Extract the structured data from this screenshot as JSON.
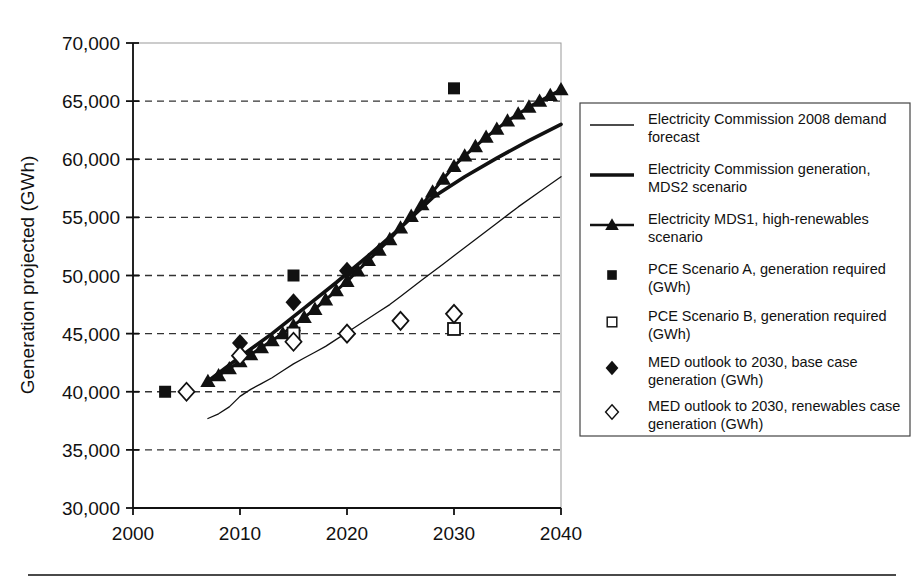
{
  "axes": {
    "ylabel": "Generation projected (GWh)",
    "xlabel": "",
    "yticks": [
      "30,000",
      "35,000",
      "40,000",
      "45,000",
      "50,000",
      "55,000",
      "60,000",
      "65,000",
      "70,000"
    ],
    "xticks": [
      "2000",
      "2010",
      "2020",
      "2030",
      "2040"
    ]
  },
  "legend": {
    "items": [
      {
        "marker": "thin-line",
        "label": "Electricity Commission 2008 demand forecast"
      },
      {
        "marker": "thick-line",
        "label": "Electricity Commission generation, MDS2 scenario"
      },
      {
        "marker": "line-triangle",
        "label": "Electricity MDS1, high-renewables scenario"
      },
      {
        "marker": "filled-square",
        "label": "PCE Scenario A, generation required (GWh)"
      },
      {
        "marker": "open-square",
        "label": "PCE Scenario B, generation required (GWh)"
      },
      {
        "marker": "filled-diamond",
        "label": "MED outlook to 2030, base case generation (GWh)"
      },
      {
        "marker": "open-diamond",
        "label": "MED outlook to 2030, renewables case generation (GWh)"
      }
    ]
  },
  "colors": {
    "ink": "#111111",
    "grid": "#333333",
    "frame": "#888888",
    "background": "#ffffff"
  },
  "chart_data": {
    "type": "line",
    "title": "",
    "xlabel": "",
    "ylabel": "Generation projected (GWh)",
    "xlim": [
      2000,
      2040
    ],
    "ylim": [
      30000,
      70000
    ],
    "grid": "horizontal-dashed",
    "legend_position": "right",
    "series": [
      {
        "name": "Electricity Commission 2008 demand forecast",
        "type": "line",
        "style": "thin-solid",
        "points": [
          {
            "x": 2007,
            "y": 37700
          },
          {
            "x": 2008,
            "y": 38100
          },
          {
            "x": 2009,
            "y": 38700
          },
          {
            "x": 2010,
            "y": 39600
          },
          {
            "x": 2011,
            "y": 40200
          },
          {
            "x": 2012,
            "y": 40700
          },
          {
            "x": 2013,
            "y": 41200
          },
          {
            "x": 2014,
            "y": 41800
          },
          {
            "x": 2015,
            "y": 42400
          },
          {
            "x": 2016,
            "y": 42900
          },
          {
            "x": 2017,
            "y": 43400
          },
          {
            "x": 2018,
            "y": 43900
          },
          {
            "x": 2019,
            "y": 44500
          },
          {
            "x": 2020,
            "y": 45100
          },
          {
            "x": 2021,
            "y": 45700
          },
          {
            "x": 2022,
            "y": 46300
          },
          {
            "x": 2023,
            "y": 46900
          },
          {
            "x": 2024,
            "y": 47500
          },
          {
            "x": 2025,
            "y": 48200
          },
          {
            "x": 2026,
            "y": 48900
          },
          {
            "x": 2027,
            "y": 49600
          },
          {
            "x": 2028,
            "y": 50300
          },
          {
            "x": 2029,
            "y": 51000
          },
          {
            "x": 2030,
            "y": 51700
          },
          {
            "x": 2032,
            "y": 53100
          },
          {
            "x": 2034,
            "y": 54500
          },
          {
            "x": 2036,
            "y": 55900
          },
          {
            "x": 2038,
            "y": 57200
          },
          {
            "x": 2040,
            "y": 58500
          }
        ]
      },
      {
        "name": "Electricity Commission generation, MDS2 scenario",
        "type": "line",
        "style": "thick-solid",
        "points": [
          {
            "x": 2007,
            "y": 40900
          },
          {
            "x": 2010,
            "y": 43000
          },
          {
            "x": 2013,
            "y": 45000
          },
          {
            "x": 2016,
            "y": 47200
          },
          {
            "x": 2019,
            "y": 49400
          },
          {
            "x": 2022,
            "y": 51700
          },
          {
            "x": 2025,
            "y": 54100
          },
          {
            "x": 2028,
            "y": 56700
          },
          {
            "x": 2031,
            "y": 58500
          },
          {
            "x": 2034,
            "y": 60100
          },
          {
            "x": 2037,
            "y": 61600
          },
          {
            "x": 2040,
            "y": 63000
          }
        ]
      },
      {
        "name": "Electricity MDS1, high-renewables scenario",
        "type": "line-marker",
        "style": "filled-triangle",
        "points": [
          {
            "x": 2007,
            "y": 40900
          },
          {
            "x": 2008,
            "y": 41400
          },
          {
            "x": 2009,
            "y": 42000
          },
          {
            "x": 2010,
            "y": 42600
          },
          {
            "x": 2011,
            "y": 43200
          },
          {
            "x": 2012,
            "y": 43800
          },
          {
            "x": 2013,
            "y": 44400
          },
          {
            "x": 2014,
            "y": 45000
          },
          {
            "x": 2015,
            "y": 45700
          },
          {
            "x": 2016,
            "y": 46400
          },
          {
            "x": 2017,
            "y": 47100
          },
          {
            "x": 2018,
            "y": 47900
          },
          {
            "x": 2019,
            "y": 48700
          },
          {
            "x": 2020,
            "y": 49500
          },
          {
            "x": 2021,
            "y": 50400
          },
          {
            "x": 2022,
            "y": 51300
          },
          {
            "x": 2023,
            "y": 52200
          },
          {
            "x": 2024,
            "y": 53100
          },
          {
            "x": 2025,
            "y": 54100
          },
          {
            "x": 2026,
            "y": 55100
          },
          {
            "x": 2027,
            "y": 56100
          },
          {
            "x": 2028,
            "y": 57200
          },
          {
            "x": 2029,
            "y": 58300
          },
          {
            "x": 2030,
            "y": 59400
          },
          {
            "x": 2031,
            "y": 60300
          },
          {
            "x": 2032,
            "y": 61100
          },
          {
            "x": 2033,
            "y": 61900
          },
          {
            "x": 2034,
            "y": 62600
          },
          {
            "x": 2035,
            "y": 63300
          },
          {
            "x": 2036,
            "y": 63900
          },
          {
            "x": 2037,
            "y": 64500
          },
          {
            "x": 2038,
            "y": 65000
          },
          {
            "x": 2039,
            "y": 65500
          },
          {
            "x": 2040,
            "y": 66000
          }
        ]
      },
      {
        "name": "PCE Scenario A, generation required (GWh)",
        "type": "scatter",
        "style": "filled-square",
        "points": [
          {
            "x": 2003,
            "y": 40000
          },
          {
            "x": 2015,
            "y": 50000
          },
          {
            "x": 2030,
            "y": 66100
          }
        ]
      },
      {
        "name": "PCE Scenario B, generation required (GWh)",
        "type": "scatter",
        "style": "open-square",
        "points": [
          {
            "x": 2015,
            "y": 45000
          },
          {
            "x": 2030,
            "y": 45400
          }
        ]
      },
      {
        "name": "MED outlook to 2030, base case generation (GWh)",
        "type": "scatter",
        "style": "filled-diamond",
        "points": [
          {
            "x": 2010,
            "y": 44200
          },
          {
            "x": 2015,
            "y": 47700
          },
          {
            "x": 2020,
            "y": 50400
          }
        ]
      },
      {
        "name": "MED outlook to 2030, renewables case generation (GWh)",
        "type": "scatter",
        "style": "open-diamond",
        "points": [
          {
            "x": 2005,
            "y": 40000
          },
          {
            "x": 2010,
            "y": 43100
          },
          {
            "x": 2015,
            "y": 44300
          },
          {
            "x": 2020,
            "y": 45000
          },
          {
            "x": 2025,
            "y": 46100
          },
          {
            "x": 2030,
            "y": 46700
          }
        ]
      }
    ]
  }
}
